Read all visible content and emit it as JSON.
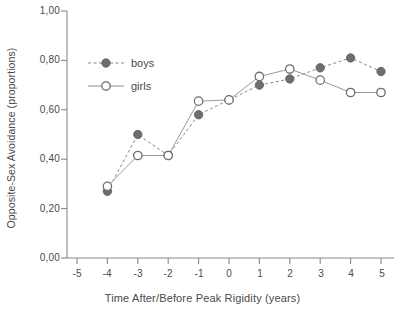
{
  "chart_data": {
    "type": "line",
    "title": "",
    "xlabel": "Time After/Before Peak Rigidity (years)",
    "ylabel": "Opposite-Sex Avoidance (proportions)",
    "x": [
      -5,
      -4,
      -3,
      -2,
      -1,
      0,
      1,
      2,
      3,
      4,
      5
    ],
    "xtick_labels": [
      "-5",
      "-4",
      "-3",
      "-2",
      "-1",
      "0",
      "1",
      "2",
      "3",
      "4",
      "5"
    ],
    "ytick_labels": [
      "0,00",
      "0,20",
      "0,40",
      "0,60",
      "0,80",
      "1,00"
    ],
    "ytick_values": [
      0.0,
      0.2,
      0.4,
      0.6,
      0.8,
      1.0
    ],
    "xlim": [
      -5,
      5
    ],
    "ylim": [
      0.0,
      1.0
    ],
    "grid": false,
    "legend_position": "upper-left-inside",
    "series": [
      {
        "name": "boys",
        "marker": "filled-circle",
        "color": "#6e6e6e",
        "linestyle": "dashed",
        "x": [
          -4,
          -3,
          -2,
          -1,
          0,
          1,
          2,
          3,
          4,
          5
        ],
        "values": [
          0.27,
          0.5,
          0.415,
          0.58,
          0.64,
          0.7,
          0.725,
          0.77,
          0.81,
          0.755
        ]
      },
      {
        "name": "girls",
        "marker": "open-circle",
        "color": "#8c8c8c",
        "linestyle": "solid",
        "x": [
          -4,
          -3,
          -2,
          -1,
          0,
          1,
          2,
          3,
          4,
          5
        ],
        "values": [
          0.29,
          0.415,
          0.415,
          0.635,
          0.64,
          0.735,
          0.765,
          0.72,
          0.67,
          0.67
        ]
      }
    ]
  },
  "legend": {
    "entries": [
      {
        "label": "boys"
      },
      {
        "label": "girls"
      }
    ]
  },
  "axes": {
    "axis_color": "#8a8a8a",
    "text_color": "#4a4a4a"
  }
}
